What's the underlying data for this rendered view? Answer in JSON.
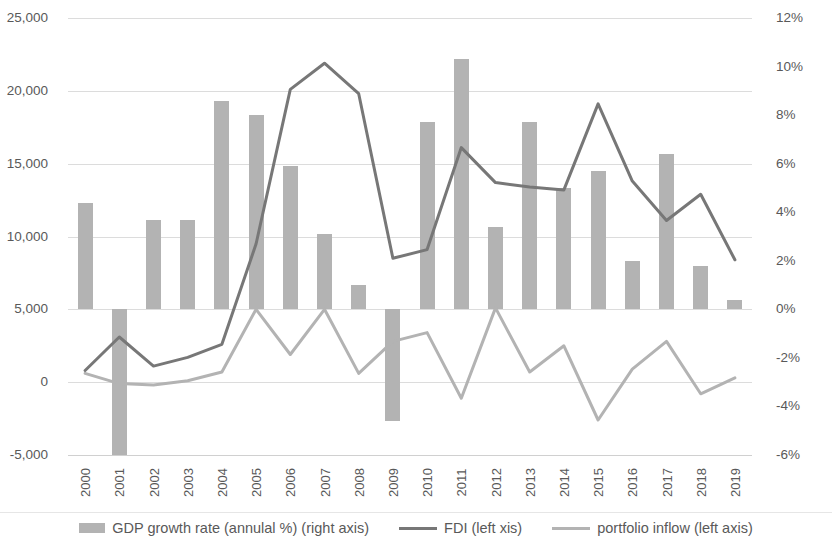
{
  "chart_data": {
    "type": "bar",
    "title": "",
    "subtitle": "",
    "xlabel": "",
    "ylabel": "",
    "grid": true,
    "legend_position": "bottom",
    "categories": [
      "2000",
      "2001",
      "2002",
      "2003",
      "2004",
      "2005",
      "2006",
      "2007",
      "2008",
      "2009",
      "2010",
      "2011",
      "2012",
      "2013",
      "2014",
      "2015",
      "2016",
      "2017",
      "2018",
      "2019"
    ],
    "left_axis": {
      "label": "",
      "ticks": [
        "-5,000",
        "0",
        "5,000",
        "10,000",
        "15,000",
        "20,000",
        "25,000"
      ],
      "tick_values": [
        -5000,
        0,
        5000,
        10000,
        15000,
        20000,
        25000
      ],
      "ylim": [
        -5000,
        25000
      ]
    },
    "right_axis": {
      "label": "",
      "ticks": [
        "-6%",
        "-4%",
        "-2%",
        "0%",
        "2%",
        "4%",
        "6%",
        "8%",
        "10%",
        "12%"
      ],
      "tick_values": [
        -6,
        -4,
        -2,
        0,
        2,
        4,
        6,
        8,
        10,
        12
      ],
      "ylim": [
        -6,
        12
      ]
    },
    "series": [
      {
        "name": "GDP growth rate (annulal %) (right axis)",
        "type": "bar",
        "axis": "right",
        "color": "#b3b3b3",
        "values": [
          4.4,
          -6.0,
          3.7,
          3.7,
          8.6,
          8.0,
          5.9,
          3.1,
          1.0,
          -4.6,
          7.7,
          10.3,
          3.4,
          7.7,
          5.0,
          5.7,
          2.0,
          6.4,
          1.8,
          0.4
        ]
      },
      {
        "name": "FDI (left xis)",
        "type": "line",
        "axis": "left",
        "color": "#777777",
        "values": [
          800,
          3100,
          1100,
          1700,
          2600,
          9500,
          20100,
          21900,
          19800,
          8500,
          9100,
          16100,
          13700,
          13400,
          13200,
          19100,
          13800,
          11100,
          12900,
          8400
        ]
      },
      {
        "name": "portfolio inflow (left axis)",
        "type": "line",
        "axis": "left",
        "color": "#b3b3b3",
        "values": [
          600,
          -100,
          -200,
          100,
          700,
          5000,
          1900,
          5000,
          600,
          2800,
          3400,
          -1100,
          5100,
          700,
          2500,
          -2600,
          900,
          2800,
          -800,
          300
        ]
      }
    ]
  },
  "legend": {
    "items": [
      {
        "label": "GDP growth rate (annulal %) (right axis)",
        "marker": "bar-swatch",
        "color": "#b3b3b3"
      },
      {
        "label": "FDI (left xis)",
        "marker": "line-swatch",
        "color": "#777777"
      },
      {
        "label": "portfolio inflow (left axis)",
        "marker": "line-swatch",
        "color": "#b3b3b3"
      }
    ]
  }
}
